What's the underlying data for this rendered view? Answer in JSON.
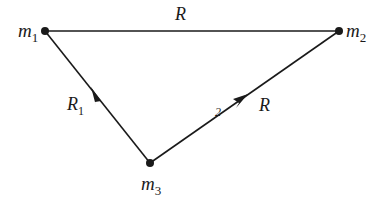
{
  "diagram": {
    "type": "three-body triangle",
    "colors": {
      "line": "#1a1a1a",
      "background": "#ffffff"
    },
    "nodes": [
      {
        "id": "m1",
        "label": "m",
        "subscript": "1",
        "x": 45,
        "y": 31
      },
      {
        "id": "m2",
        "label": "m",
        "subscript": "2",
        "x": 339,
        "y": 31
      },
      {
        "id": "m3",
        "label": "m",
        "subscript": "3",
        "x": 150,
        "y": 163
      }
    ],
    "edges": [
      {
        "from": "m1",
        "to": "m2",
        "label": "R",
        "subscript": "",
        "arrow": false
      },
      {
        "from": "m3",
        "to": "m1",
        "label": "R",
        "subscript": "1",
        "arrow": true
      },
      {
        "from": "m3",
        "to": "m2",
        "label": "R",
        "subscript": "",
        "arrow": true,
        "mark": "2"
      }
    ]
  }
}
